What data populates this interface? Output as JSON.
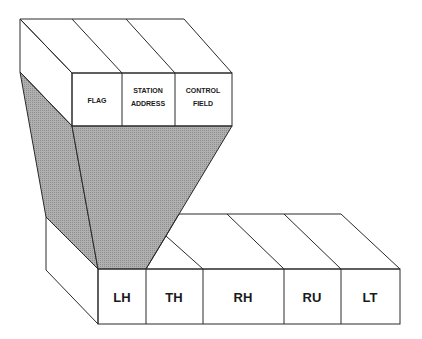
{
  "diagram": {
    "title": "",
    "upper_frame": {
      "fields": [
        {
          "line1": "FLAG",
          "line2": ""
        },
        {
          "line1": "STATION",
          "line2": "ADDRESS"
        },
        {
          "line1": "CONTROL",
          "line2": "FIELD"
        }
      ]
    },
    "lower_frame": {
      "fields": [
        "LH",
        "TH",
        "RH",
        "RU",
        "LT"
      ]
    },
    "colors": {
      "face": "#ffffff",
      "funnel": "#a9a9a9",
      "side_hatch": "#c8c8c8",
      "stroke": "#2a2a2a"
    }
  }
}
